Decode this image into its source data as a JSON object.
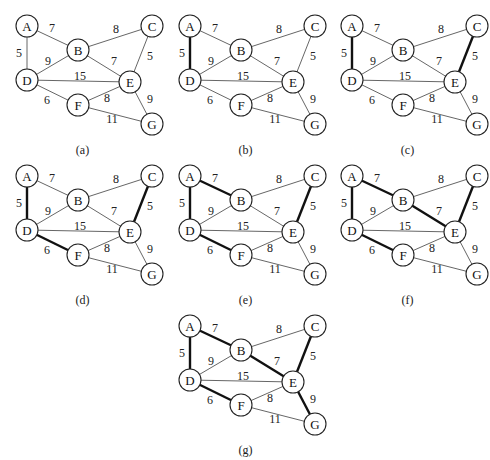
{
  "figure": {
    "nodes": [
      {
        "id": "A",
        "x": 27,
        "y": 26
      },
      {
        "id": "B",
        "x": 78,
        "y": 50
      },
      {
        "id": "C",
        "x": 152,
        "y": 26
      },
      {
        "id": "D",
        "x": 27,
        "y": 80
      },
      {
        "id": "E",
        "x": 130,
        "y": 82
      },
      {
        "id": "F",
        "x": 78,
        "y": 105
      },
      {
        "id": "G",
        "x": 152,
        "y": 124
      }
    ],
    "edges": [
      {
        "u": "A",
        "v": "B",
        "w": "7",
        "lx": 52,
        "ly": 28
      },
      {
        "u": "A",
        "v": "D",
        "w": "5",
        "lx": 19,
        "ly": 53
      },
      {
        "u": "B",
        "v": "C",
        "w": "8",
        "lx": 116,
        "ly": 29
      },
      {
        "u": "B",
        "v": "D",
        "w": "9",
        "lx": 48,
        "ly": 61
      },
      {
        "u": "B",
        "v": "E",
        "w": "7",
        "lx": 114,
        "ly": 61
      },
      {
        "u": "C",
        "v": "E",
        "w": "5",
        "lx": 150,
        "ly": 56
      },
      {
        "u": "D",
        "v": "E",
        "w": "15",
        "lx": 80,
        "ly": 76
      },
      {
        "u": "D",
        "v": "F",
        "w": "6",
        "lx": 47,
        "ly": 100
      },
      {
        "u": "F",
        "v": "E",
        "w": "8",
        "lx": 107,
        "ly": 98
      },
      {
        "u": "E",
        "v": "G",
        "w": "9",
        "lx": 150,
        "ly": 99
      },
      {
        "u": "F",
        "v": "G",
        "w": "11",
        "lx": 112,
        "ly": 119
      }
    ],
    "panels": [
      {
        "caption": "(a)",
        "x": 0,
        "y": 0,
        "mst_edges": []
      },
      {
        "caption": "(b)",
        "x": 163,
        "y": 0,
        "mst_edges": [
          "A-D"
        ]
      },
      {
        "caption": "(c)",
        "x": 325,
        "y": 0,
        "mst_edges": [
          "A-D",
          "C-E"
        ]
      },
      {
        "caption": "(d)",
        "x": 0,
        "y": 150,
        "mst_edges": [
          "A-D",
          "C-E",
          "D-F"
        ]
      },
      {
        "caption": "(e)",
        "x": 163,
        "y": 150,
        "mst_edges": [
          "A-D",
          "C-E",
          "D-F",
          "A-B"
        ]
      },
      {
        "caption": "(f)",
        "x": 325,
        "y": 150,
        "mst_edges": [
          "A-D",
          "C-E",
          "D-F",
          "A-B",
          "B-E"
        ]
      },
      {
        "caption": "(g)",
        "x": 163,
        "y": 300,
        "mst_edges": [
          "A-D",
          "C-E",
          "D-F",
          "A-B",
          "B-E",
          "E-G"
        ]
      }
    ]
  }
}
